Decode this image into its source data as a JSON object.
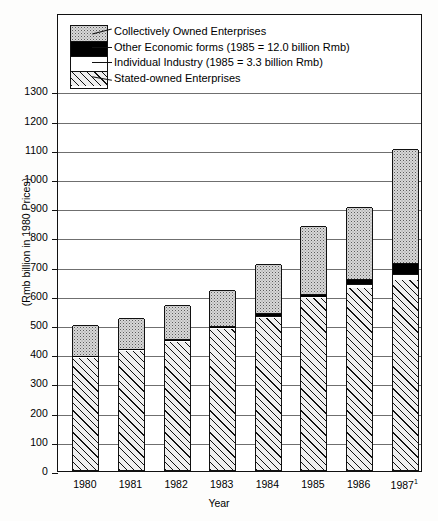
{
  "chart_data": {
    "type": "bar",
    "subtype": "stacked-bar",
    "title": "",
    "xlabel": "Year",
    "ylabel": "(Rmb billion in 1980 Prices)",
    "categories": [
      "1980",
      "1981",
      "1982",
      "1983",
      "1984",
      "1985",
      "1986",
      "1987"
    ],
    "category_superscripts": [
      "",
      "",
      "",
      "",
      "",
      "",
      "",
      "1"
    ],
    "ylim": [
      0,
      1350
    ],
    "yticks": [
      0,
      100,
      200,
      300,
      400,
      500,
      600,
      700,
      800,
      900,
      1000,
      1100,
      1200,
      1300
    ],
    "ytick_labels": [
      "0",
      "100",
      "200",
      "300",
      "400",
      "500",
      "600",
      "700",
      "800",
      "900",
      "1000",
      "1100",
      "1200",
      "1300"
    ],
    "grid": true,
    "grid_axis": "y",
    "legend_position": "upper-left-inside",
    "series": [
      {
        "name": "Stated-owned Enterprises",
        "pattern": "diagonal-hatch",
        "values": [
          385,
          408,
          438,
          482,
          520,
          588,
          625,
          650
        ]
      },
      {
        "name": "Individual Industry",
        "pattern": "white-dotted",
        "note": "(1985 = 3.3 billion Rmb)",
        "values": [
          2,
          3,
          4,
          5,
          8,
          3.3,
          12,
          22
        ]
      },
      {
        "name": "Other Economic forms",
        "pattern": "solid-black",
        "note": "(1985 = 12.0 billion Rmb)",
        "values": [
          3,
          4,
          5,
          6,
          9,
          12,
          18,
          38
        ]
      },
      {
        "name": "Collectively Owned Enterprises",
        "pattern": "grey-stipple",
        "values": [
          105,
          105,
          118,
          122,
          168,
          232,
          245,
          390
        ]
      }
    ],
    "totals": [
      495,
      520,
      565,
      615,
      705,
      835,
      900,
      1100
    ]
  },
  "legend": {
    "entries": [
      {
        "label": "Collectively Owned Enterprises",
        "pattern": "grey-stipple"
      },
      {
        "label": "Other Economic forms (1985 = 12.0 billion Rmb)",
        "pattern": "solid-black"
      },
      {
        "label": "Individual Industry (1985 = 3.3 billion Rmb)",
        "pattern": "white-dotted"
      },
      {
        "label": "Stated-owned Enterprises",
        "pattern": "diagonal-hatch"
      }
    ]
  },
  "axes": {
    "y_title": "(Rmb billion in 1980 Prices)",
    "x_title": "Year"
  },
  "colors": {
    "frame": "#111111",
    "gridline": "#6f6f6f",
    "state_owned": "#efefef",
    "individual": "#ffffff",
    "other": "#000000",
    "collective": "#d8d8d8",
    "background": "#ffffff"
  }
}
